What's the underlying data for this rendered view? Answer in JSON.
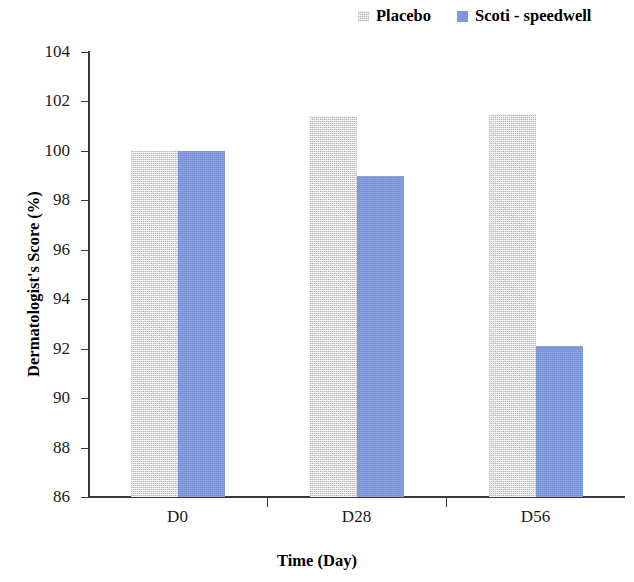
{
  "chart_data": {
    "type": "bar",
    "title": "",
    "categories": [
      "D0",
      "D28",
      "D56"
    ],
    "series": [
      {
        "name": "Placebo",
        "values": [
          100,
          101.4,
          101.5
        ],
        "color": "#d3d3d3"
      },
      {
        "name": "Scoti - speedwell",
        "values": [
          100,
          99,
          92.1
        ],
        "color": "#8099dc"
      }
    ],
    "xlabel": "Time (Day)",
    "ylabel": "Dermatologist's Score (%)",
    "ylim": [
      86,
      104
    ],
    "yticks": [
      86,
      88,
      90,
      92,
      94,
      96,
      98,
      100,
      102,
      104
    ],
    "ytick_labels": [
      "86",
      "88",
      "90",
      "92",
      "94",
      "96",
      "98",
      "100",
      "102",
      "104"
    ],
    "grid": false,
    "legend_position": "top-right"
  },
  "legend": {
    "entries": [
      {
        "label": "Placebo",
        "swatch": "placebo-swatch"
      },
      {
        "label": "Scoti - speedwell",
        "swatch": "scoti-swatch"
      }
    ]
  },
  "axes": {
    "y_title": "Dermatologist's Score (%)",
    "x_title": "Time (Day)"
  }
}
